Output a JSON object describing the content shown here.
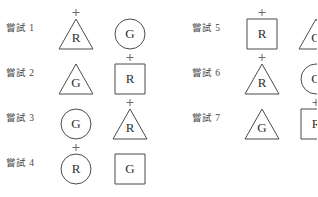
{
  "sheet": {
    "title": "嘗試 stimulus sheet",
    "plus_mark_glyph": "+",
    "outline_color": "#4b4b4b",
    "letter_color": "#2f2f2f",
    "label_color": "#454545",
    "background_color": "#ffffff"
  },
  "columns": [
    {
      "name": "left-column",
      "trials": [
        {
          "label": "嘗試 1",
          "stimuli": [
            {
              "shape": "triangle",
              "letter": "R",
              "marked": true
            },
            {
              "shape": "circle",
              "letter": "G",
              "marked": false
            }
          ]
        },
        {
          "label": "嘗試 2",
          "stimuli": [
            {
              "shape": "triangle",
              "letter": "G",
              "marked": false
            },
            {
              "shape": "square",
              "letter": "R",
              "marked": true
            }
          ]
        },
        {
          "label": "嘗試 3",
          "stimuli": [
            {
              "shape": "circle",
              "letter": "G",
              "marked": false
            },
            {
              "shape": "triangle",
              "letter": "R",
              "marked": true
            }
          ]
        },
        {
          "label": "嘗試 4",
          "stimuli": [
            {
              "shape": "circle",
              "letter": "R",
              "marked": true
            },
            {
              "shape": "square",
              "letter": "G",
              "marked": false
            }
          ]
        }
      ]
    },
    {
      "name": "right-column",
      "trials": [
        {
          "label": "嘗試 5",
          "stimuli": [
            {
              "shape": "square",
              "letter": "R",
              "marked": true
            },
            {
              "shape": "triangle",
              "letter": "G",
              "marked": false
            }
          ]
        },
        {
          "label": "嘗試 6",
          "stimuli": [
            {
              "shape": "triangle",
              "letter": "R",
              "marked": true
            },
            {
              "shape": "circle",
              "letter": "G",
              "marked": false
            }
          ]
        },
        {
          "label": "嘗試 7",
          "stimuli": [
            {
              "shape": "triangle",
              "letter": "G",
              "marked": false
            },
            {
              "shape": "square",
              "letter": "R",
              "marked": true
            }
          ]
        }
      ]
    }
  ]
}
